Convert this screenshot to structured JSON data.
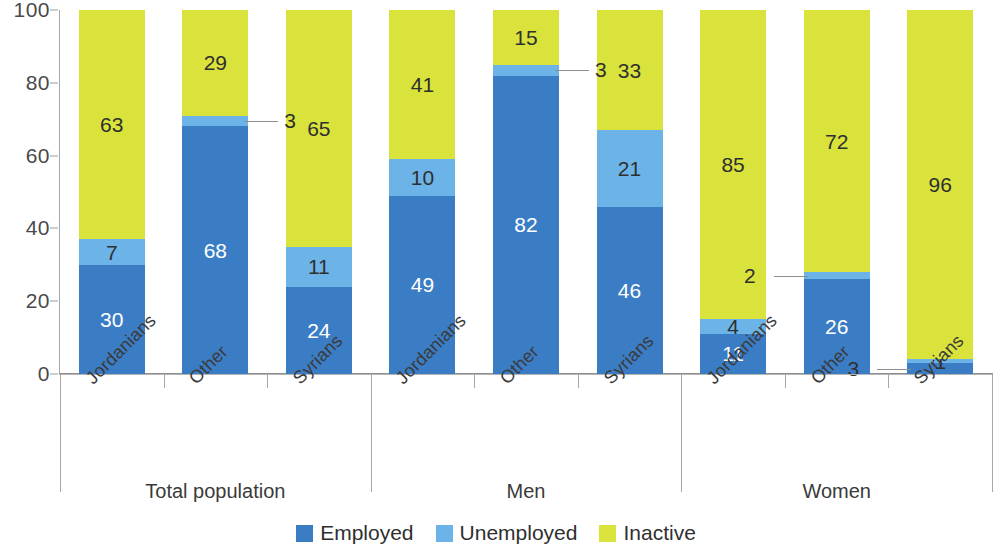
{
  "chart_data": {
    "type": "bar",
    "subtype": "stacked-100-percent",
    "title": "",
    "subtitle": "",
    "xlabel": "",
    "ylabel": "",
    "ylim": [
      0,
      100
    ],
    "yticks": [
      0,
      20,
      40,
      60,
      80,
      100
    ],
    "grid": false,
    "legend_position": "bottom-center",
    "categories": [
      "Jordanians",
      "Other",
      "Syrians",
      "Jordanians",
      "Other",
      "Syrians",
      "Jordanians",
      "Other",
      "Syrians"
    ],
    "groups": [
      {
        "label": "Total population",
        "categories": [
          "Jordanians",
          "Other",
          "Syrians"
        ]
      },
      {
        "label": "Men",
        "categories": [
          "Jordanians",
          "Other",
          "Syrians"
        ]
      },
      {
        "label": "Women",
        "categories": [
          "Jordanians",
          "Other",
          "Syrians"
        ]
      }
    ],
    "series": [
      {
        "name": "Employed",
        "color": "#3b7dc4",
        "values": [
          30,
          68,
          24,
          49,
          82,
          46,
          11,
          26,
          3
        ]
      },
      {
        "name": "Unemployed",
        "color": "#6cb4e8",
        "values": [
          7,
          3,
          11,
          10,
          3,
          21,
          4,
          2,
          1
        ]
      },
      {
        "name": "Inactive",
        "color": "#d9e33c",
        "values": [
          63,
          29,
          65,
          41,
          15,
          33,
          85,
          72,
          96
        ]
      }
    ],
    "bars": [
      {
        "group": "Total population",
        "category": "Jordanians",
        "segments": [
          {
            "series": "Employed",
            "value": 30,
            "label": "30",
            "label_mode": "inside"
          },
          {
            "series": "Unemployed",
            "value": 7,
            "label": "7",
            "label_mode": "inside"
          },
          {
            "series": "Inactive",
            "value": 63,
            "label": "63",
            "label_mode": "inside"
          }
        ]
      },
      {
        "group": "Total population",
        "category": "Other",
        "segments": [
          {
            "series": "Employed",
            "value": 68,
            "label": "68",
            "label_mode": "inside"
          },
          {
            "series": "Unemployed",
            "value": 3,
            "label": "3",
            "label_mode": "callout-right"
          },
          {
            "series": "Inactive",
            "value": 29,
            "label": "29",
            "label_mode": "inside"
          }
        ]
      },
      {
        "group": "Total population",
        "category": "Syrians",
        "segments": [
          {
            "series": "Employed",
            "value": 24,
            "label": "24",
            "label_mode": "inside"
          },
          {
            "series": "Unemployed",
            "value": 11,
            "label": "11",
            "label_mode": "inside"
          },
          {
            "series": "Inactive",
            "value": 65,
            "label": "65",
            "label_mode": "inside"
          }
        ]
      },
      {
        "group": "Men",
        "category": "Jordanians",
        "segments": [
          {
            "series": "Employed",
            "value": 49,
            "label": "49",
            "label_mode": "inside"
          },
          {
            "series": "Unemployed",
            "value": 10,
            "label": "10",
            "label_mode": "inside"
          },
          {
            "series": "Inactive",
            "value": 41,
            "label": "41",
            "label_mode": "inside"
          }
        ]
      },
      {
        "group": "Men",
        "category": "Other",
        "segments": [
          {
            "series": "Employed",
            "value": 82,
            "label": "82",
            "label_mode": "inside"
          },
          {
            "series": "Unemployed",
            "value": 3,
            "label": "3",
            "label_mode": "callout-right"
          },
          {
            "series": "Inactive",
            "value": 15,
            "label": "15",
            "label_mode": "inside"
          }
        ]
      },
      {
        "group": "Men",
        "category": "Syrians",
        "segments": [
          {
            "series": "Employed",
            "value": 46,
            "label": "46",
            "label_mode": "inside"
          },
          {
            "series": "Unemployed",
            "value": 21,
            "label": "21",
            "label_mode": "inside"
          },
          {
            "series": "Inactive",
            "value": 33,
            "label": "33",
            "label_mode": "inside"
          }
        ]
      },
      {
        "group": "Women",
        "category": "Jordanians",
        "segments": [
          {
            "series": "Employed",
            "value": 11,
            "label": "11",
            "label_mode": "inside"
          },
          {
            "series": "Unemployed",
            "value": 4,
            "label": "4",
            "label_mode": "inside"
          },
          {
            "series": "Inactive",
            "value": 85,
            "label": "85",
            "label_mode": "inside"
          }
        ]
      },
      {
        "group": "Women",
        "category": "Other",
        "segments": [
          {
            "series": "Employed",
            "value": 26,
            "label": "26",
            "label_mode": "inside"
          },
          {
            "series": "Unemployed",
            "value": 2,
            "label": "2",
            "label_mode": "callout-left"
          },
          {
            "series": "Inactive",
            "value": 72,
            "label": "72",
            "label_mode": "inside"
          }
        ]
      },
      {
        "group": "Women",
        "category": "Syrians",
        "segments": [
          {
            "series": "Employed",
            "value": 3,
            "label": "3",
            "label_mode": "callout-left"
          },
          {
            "series": "Unemployed",
            "value": 1,
            "label": "1",
            "label_mode": "inside"
          },
          {
            "series": "Inactive",
            "value": 96,
            "label": "96",
            "label_mode": "inside"
          }
        ]
      }
    ],
    "callouts": [
      {
        "text": "3",
        "bar_index": 1,
        "series": "Unemployed",
        "side": "right"
      },
      {
        "text": "3",
        "bar_index": 4,
        "series": "Unemployed",
        "side": "right"
      },
      {
        "text": "2",
        "bar_index": 7,
        "series": "Unemployed",
        "side": "left"
      },
      {
        "text": "3",
        "bar_index": 8,
        "series": "Employed",
        "side": "left"
      }
    ]
  },
  "yaxis": {
    "ticks": [
      "0",
      "20",
      "40",
      "60",
      "80",
      "100"
    ]
  },
  "legend": {
    "items": [
      {
        "label": "Employed",
        "color": "#3b7dc4"
      },
      {
        "label": "Unemployed",
        "color": "#6cb4e8"
      },
      {
        "label": "Inactive",
        "color": "#d9e33c"
      }
    ]
  },
  "colors": {
    "employed": "#3b7dc4",
    "unemployed": "#6cb4e8",
    "inactive": "#d9e33c",
    "axis": "#a8a8a8",
    "text": "#3a3a3a"
  }
}
